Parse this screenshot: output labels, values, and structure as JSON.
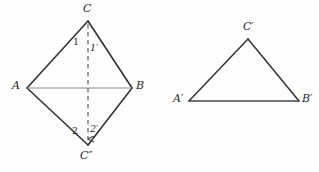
{
  "figure": {
    "background_color": "#fefefe",
    "stroke_color": "#333333",
    "light_stroke_color": "#8a8a8a",
    "dash_color": "#555555",
    "width": 319,
    "height": 172
  },
  "left_figure": {
    "name": "kite-ACBC2",
    "vertices": {
      "C": {
        "label": "C",
        "x": 88,
        "y": 21
      },
      "A": {
        "label": "A",
        "x": 27,
        "y": 88
      },
      "B": {
        "label": "B",
        "x": 132,
        "y": 88
      },
      "Cpp": {
        "label": "C″",
        "x": 88,
        "y": 145
      }
    },
    "vertex_label_positions": {
      "C": {
        "x": 83,
        "y": 3
      },
      "A": {
        "x": 12,
        "y": 80
      },
      "B": {
        "x": 136,
        "y": 80
      },
      "Cpp": {
        "x": 80,
        "y": 150
      }
    },
    "edges": [
      {
        "name": "edge-A-C",
        "from": "A",
        "to": "C",
        "style": "solid-dark"
      },
      {
        "name": "edge-C-B",
        "from": "C",
        "to": "B",
        "style": "solid-dark"
      },
      {
        "name": "edge-A-Cpp",
        "from": "A",
        "to": "Cpp",
        "style": "solid-dark"
      },
      {
        "name": "edge-Cpp-B",
        "from": "Cpp",
        "to": "B",
        "style": "solid-dark"
      },
      {
        "name": "edge-A-B",
        "from": "A",
        "to": "B",
        "style": "solid-light"
      }
    ],
    "fold_line": {
      "name": "fold-line-C-Cpp",
      "from": "C",
      "to": "Cpp",
      "style": "dashed",
      "arrowhead": "down"
    },
    "angle_labels": [
      {
        "name": "angle-1",
        "text": "1",
        "x": 73,
        "y": 37,
        "prime": false
      },
      {
        "name": "angle-1-prime",
        "text": "1′",
        "x": 90,
        "y": 43,
        "prime": true
      },
      {
        "name": "angle-2",
        "text": "2",
        "x": 72,
        "y": 126,
        "prime": false
      },
      {
        "name": "angle-2-prime",
        "text": "2′",
        "x": 90,
        "y": 124,
        "prime": true
      }
    ]
  },
  "right_figure": {
    "name": "triangle-ApBpCp",
    "vertices": {
      "Ap": {
        "label": "A′",
        "x": 189,
        "y": 101
      },
      "Bp": {
        "label": "B′",
        "x": 299,
        "y": 101
      },
      "Cp": {
        "label": "C′",
        "x": 248,
        "y": 39
      }
    },
    "vertex_label_positions": {
      "Ap": {
        "x": 173,
        "y": 93
      },
      "Bp": {
        "x": 302,
        "y": 93
      },
      "Cp": {
        "x": 243,
        "y": 21
      }
    },
    "edges": [
      {
        "name": "edge-Ap-Cp",
        "from": "Ap",
        "to": "Cp",
        "style": "solid-dark"
      },
      {
        "name": "edge-Cp-Bp",
        "from": "Cp",
        "to": "Bp",
        "style": "solid-dark"
      },
      {
        "name": "edge-Ap-Bp",
        "from": "Ap",
        "to": "Bp",
        "style": "solid-dark"
      }
    ]
  }
}
